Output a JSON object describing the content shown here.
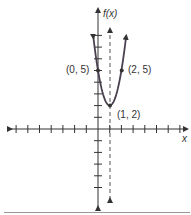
{
  "chart_data": {
    "type": "line",
    "title": "",
    "function": "f(x) = 3(x - 1)^2 + 2",
    "xlabel": "x",
    "ylabel": "f(x)",
    "x_ticks_negative": 7,
    "x_ticks_positive": 7,
    "y_ticks_positive": 8,
    "y_ticks_negative": 5,
    "grid": false,
    "axis_of_symmetry": {
      "x": 1,
      "style": "dashed"
    },
    "points": [
      {
        "x": 0,
        "y": 5,
        "label": "(0, 5)"
      },
      {
        "x": 1,
        "y": 2,
        "label": "(1, 2)"
      },
      {
        "x": 2,
        "y": 5,
        "label": "(2, 5)"
      }
    ],
    "series": [
      {
        "name": "parabola",
        "x": [
          -0.4,
          0,
          0.5,
          1,
          1.5,
          2,
          2.4
        ],
        "y": [
          7.88,
          5,
          2.75,
          2,
          2.75,
          5,
          7.88
        ]
      }
    ]
  },
  "labels": {
    "y_axis": "f(x)",
    "x_axis": "x",
    "p0": "(0, 5)",
    "p1": "(2, 5)",
    "vertex": "(1, 2)"
  },
  "colors": {
    "axis": "#333333",
    "curve": "#4a4050",
    "dashed": "#555555"
  }
}
